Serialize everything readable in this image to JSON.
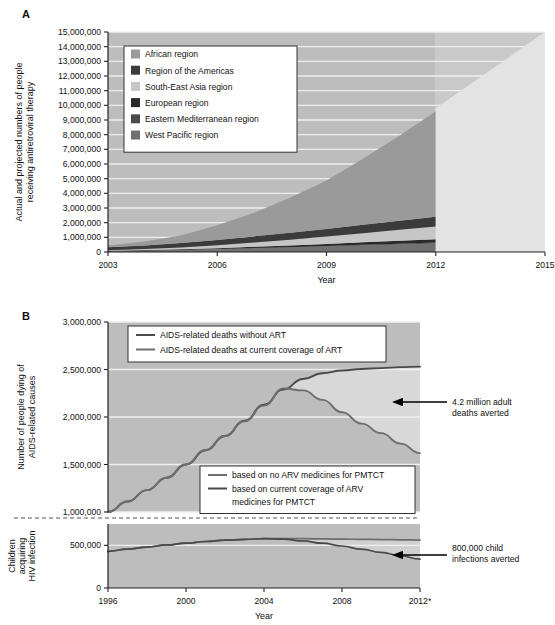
{
  "figure": {
    "panel_a_letter": "A",
    "panel_b_letter": "B"
  },
  "chart_data": [
    {
      "id": "panel_a",
      "type": "area",
      "title": "",
      "xlabel": "Year",
      "ylabel": "Actual and projected numbers of people receiving antiretroviral therapy",
      "xlim": [
        2003,
        2015
      ],
      "ylim": [
        0,
        15000000
      ],
      "x_ticks": [
        "2003",
        "2006",
        "2009",
        "2012",
        "2015"
      ],
      "x_tick_values": [
        2003,
        2006,
        2009,
        2012,
        2015
      ],
      "y_ticks": [
        "0",
        "1,000,000",
        "2,000,000",
        "3,000,000",
        "4,000,000",
        "5,000,000",
        "6,000,000",
        "7,000,000",
        "8,000,000",
        "9,000,000",
        "10,000,000",
        "11,000,000",
        "12,000,000",
        "13,000,000",
        "14,000,000",
        "15,000,000"
      ],
      "y_tick_values": [
        0,
        1000000,
        2000000,
        3000000,
        4000000,
        5000000,
        6000000,
        7000000,
        8000000,
        9000000,
        10000000,
        11000000,
        12000000,
        13000000,
        14000000,
        15000000
      ],
      "grid": true,
      "legend_position": "upper-left",
      "stacking_order_bottom_to_top": [
        "West Pacific region",
        "Eastern Mediterranean region",
        "European region",
        "South-East Asia region",
        "Region of the Americas",
        "African region"
      ],
      "series": [
        {
          "name": "African region",
          "color": "#9a9a9a",
          "values": [
            120000,
            260000,
            520000,
            1000000,
            1600000,
            2400000,
            3300000,
            4500000,
            5800000,
            7200000
          ]
        },
        {
          "name": "Region of the Americas",
          "color": "#3b3b3b",
          "values": [
            200000,
            250000,
            300000,
            360000,
            420000,
            470000,
            520000,
            570000,
            620000,
            660000
          ]
        },
        {
          "name": "South-East Asia region",
          "color": "#c6c6c6",
          "values": [
            40000,
            70000,
            120000,
            200000,
            290000,
            390000,
            500000,
            620000,
            740000,
            860000
          ]
        },
        {
          "name": "European region",
          "color": "#2a2a2a",
          "values": [
            20000,
            30000,
            45000,
            65000,
            90000,
            115000,
            145000,
            175000,
            205000,
            235000
          ]
        },
        {
          "name": "Eastern Mediterranean region",
          "color": "#4a4a4a",
          "values": [
            5000,
            8000,
            12000,
            18000,
            24000,
            30000,
            38000,
            46000,
            54000,
            62000
          ]
        },
        {
          "name": "West Pacific region",
          "color": "#717171",
          "values": [
            60000,
            90000,
            130000,
            180000,
            240000,
            300000,
            370000,
            440000,
            510000,
            580000
          ]
        }
      ],
      "x_values": [
        2003,
        2004,
        2005,
        2006,
        2007,
        2008,
        2009,
        2010,
        2011,
        2012
      ],
      "projection": {
        "label": "projected",
        "color": "#e3e3e3",
        "from_year": 2012,
        "to_year": 2015,
        "from_value": 9800000,
        "to_value": 15000000
      },
      "total_line": [
        445000,
        708000,
        1127000,
        1823000,
        2664000,
        3705000,
        4873000,
        6351000,
        7924000,
        9598000
      ],
      "legend_items": [
        {
          "label": "African region",
          "color": "#9a9a9a"
        },
        {
          "label": "Region of the Americas",
          "color": "#3b3b3b"
        },
        {
          "label": "South-East Asia region",
          "color": "#c6c6c6"
        },
        {
          "label": "European region",
          "color": "#2a2a2a"
        },
        {
          "label": "Eastern Mediterranean region",
          "color": "#4a4a4a"
        },
        {
          "label": "West Pacific region",
          "color": "#717171"
        }
      ]
    },
    {
      "id": "panel_b_upper",
      "type": "line",
      "title": "",
      "xlabel": "Year",
      "ylabel": "Number of people dying of AIDS-related causes",
      "xlim": [
        1996,
        2012
      ],
      "ylim": [
        1000000,
        3000000
      ],
      "x_ticks": [
        "1996",
        "2000",
        "2004",
        "2008",
        "2012*"
      ],
      "x_tick_values": [
        1996,
        2000,
        2004,
        2008,
        2012
      ],
      "y_ticks": [
        "1,000,000",
        "1,500,000",
        "2,000,000",
        "2,500,000",
        "3,000,000"
      ],
      "y_tick_values": [
        1000000,
        1500000,
        2000000,
        2500000,
        3000000
      ],
      "grid": true,
      "legend_position": "upper-left",
      "x_values": [
        1996,
        1997,
        1998,
        1999,
        2000,
        2001,
        2002,
        2003,
        2004,
        2005,
        2006,
        2007,
        2008,
        2009,
        2010,
        2011,
        2012
      ],
      "series": [
        {
          "name": "AIDS-related deaths without ART",
          "color": "#4a4a4a",
          "values": [
            1000000,
            1110000,
            1230000,
            1360000,
            1500000,
            1650000,
            1800000,
            1960000,
            2130000,
            2290000,
            2400000,
            2460000,
            2490000,
            2505000,
            2515000,
            2525000,
            2530000
          ]
        },
        {
          "name": "AIDS-related deaths at current coverage of ART",
          "color": "#6d6d6d",
          "values": [
            1000000,
            1110000,
            1230000,
            1360000,
            1500000,
            1650000,
            1800000,
            1955000,
            2120000,
            2300000,
            2280000,
            2180000,
            2050000,
            1930000,
            1830000,
            1720000,
            1620000
          ]
        }
      ],
      "legend_items": [
        {
          "label": "AIDS-related deaths without ART",
          "color": "#4a4a4a"
        },
        {
          "label": "AIDS-related deaths at current coverage of ART",
          "color": "#6d6d6d"
        }
      ],
      "annotation": {
        "text_line1": "4.2 million adult",
        "text_line2": "deaths averted",
        "arrow": "left-arrow"
      }
    },
    {
      "id": "panel_b_lower",
      "type": "line",
      "title": "",
      "xlabel": "Year",
      "ylabel": "Children acquiring HIV infection",
      "xlim": [
        1996,
        2012
      ],
      "ylim": [
        0,
        750000
      ],
      "x_ticks": [
        "1996",
        "2000",
        "2004",
        "2008",
        "2012*"
      ],
      "x_tick_values": [
        1996,
        2000,
        2004,
        2008,
        2012
      ],
      "y_ticks": [
        "0",
        "500,000"
      ],
      "y_tick_values": [
        0,
        500000
      ],
      "grid": true,
      "legend_position": "upper-right",
      "x_values": [
        1996,
        1997,
        1998,
        1999,
        2000,
        2001,
        2002,
        2003,
        2004,
        2005,
        2006,
        2007,
        2008,
        2009,
        2010,
        2011,
        2012
      ],
      "series": [
        {
          "name": "based on no ARV medicines for PMTCT",
          "color": "#6d6d6d",
          "values": [
            430000,
            455000,
            480000,
            505000,
            525000,
            545000,
            560000,
            570000,
            578000,
            580000,
            578000,
            575000,
            572000,
            570000,
            568000,
            565000,
            562000
          ]
        },
        {
          "name": "based on current coverage of ARV medicines for PMTCT",
          "color": "#4a4a4a",
          "values": [
            430000,
            455000,
            480000,
            505000,
            525000,
            545000,
            560000,
            570000,
            578000,
            572000,
            552000,
            525000,
            492000,
            455000,
            418000,
            378000,
            338000
          ]
        }
      ],
      "legend_items": [
        {
          "label": "based on no ARV medicines for PMTCT",
          "color": "#6d6d6d"
        },
        {
          "label": "based on current coverage of ARV",
          "label2": "medicines for PMTCT",
          "color": "#4a4a4a"
        }
      ],
      "annotation": {
        "text_line1": "800,000 child",
        "text_line2": "infections averted",
        "arrow": "left-arrow"
      }
    }
  ],
  "colors": {
    "plot_background": "#bdbdbd",
    "plot_background_light": "#d6d6d6",
    "gridline": "#efefef",
    "axis": "#222222",
    "legend_background": "#ffffff",
    "legend_border": "#333333"
  }
}
